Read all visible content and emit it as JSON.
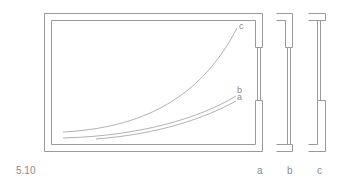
{
  "figure": {
    "number": "5.10",
    "line_color": "#9a9a9a",
    "curve_color": "#a8a8a8",
    "text_color": "#8a8a8a"
  },
  "curves": [
    {
      "id": "c",
      "label": "c"
    },
    {
      "id": "b",
      "label": "b"
    },
    {
      "id": "a",
      "label": "a"
    }
  ],
  "sections": [
    {
      "id": "a",
      "label": "a"
    },
    {
      "id": "b",
      "label": "b"
    },
    {
      "id": "c",
      "label": "c"
    }
  ]
}
